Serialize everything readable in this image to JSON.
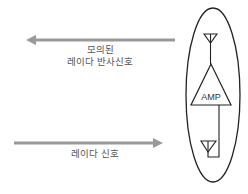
{
  "diagram": {
    "reflected_signal": {
      "line1": "모의된",
      "line2": "레이다 반사신호",
      "direction": "left"
    },
    "radar_signal": {
      "label": "레이다 신호",
      "direction": "right"
    },
    "device": {
      "amp_label": "AMP",
      "components": [
        "receive-antenna",
        "amplifier",
        "transmit-antenna"
      ]
    },
    "colors": {
      "arrow": "#999999",
      "stroke": "#222222",
      "text": "#555555"
    }
  }
}
